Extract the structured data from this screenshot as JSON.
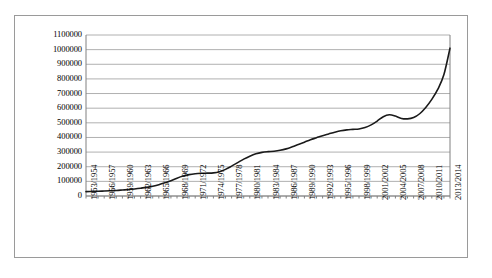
{
  "chart_data": {
    "type": "line",
    "title": "",
    "subtitle": "",
    "xlabel": "",
    "ylabel": "",
    "grid": true,
    "legend": false,
    "legend_position": "none",
    "line_color": "#1a1a1a",
    "gridline_color": "#b0b0b0",
    "axis_color": "#808080",
    "border_color": "#9a9a9a",
    "background_color": "#ffffff",
    "ylim": [
      0,
      1100000
    ],
    "ytick_step": 100000,
    "ytick_labels": [
      "1100000",
      "1000000",
      "900000",
      "800000",
      "700000",
      "600000",
      "500000",
      "400000",
      "300000",
      "200000",
      "100000",
      "0"
    ],
    "ytick_values": [
      1100000,
      1000000,
      900000,
      800000,
      700000,
      600000,
      500000,
      400000,
      300000,
      200000,
      100000,
      0
    ],
    "xtick_labels": [
      "1953/1954",
      "1956/1957",
      "1959/1960",
      "1962/1963",
      "1965/1966",
      "1968/1969",
      "1971/1972",
      "1974/1975",
      "1977/1978",
      "1980/1981",
      "1983/1984",
      "1986/1987",
      "1989/1990",
      "1992/1993",
      "1995/1996",
      "1998/1999",
      "2001/2002",
      "2004/2005",
      "2007/2008",
      "2010/2011",
      "2013/2014"
    ],
    "xtick_label_interval": 3,
    "categories": [
      "1953/1954",
      "1954/1955",
      "1955/1956",
      "1956/1957",
      "1957/1958",
      "1958/1959",
      "1959/1960",
      "1960/1961",
      "1961/1962",
      "1962/1963",
      "1963/1964",
      "1964/1965",
      "1965/1966",
      "1966/1967",
      "1967/1968",
      "1968/1969",
      "1969/1970",
      "1970/1971",
      "1971/1972",
      "1972/1973",
      "1973/1974",
      "1974/1975",
      "1975/1976",
      "1976/1977",
      "1977/1978",
      "1978/1979",
      "1979/1980",
      "1980/1981",
      "1981/1982",
      "1982/1983",
      "1983/1984",
      "1984/1985",
      "1985/1986",
      "1986/1987",
      "1987/1988",
      "1988/1989",
      "1989/1990",
      "1990/1991",
      "1991/1992",
      "1992/1993",
      "1993/1994",
      "1994/1995",
      "1995/1996",
      "1996/1997",
      "1997/1998",
      "1998/1999",
      "1999/2000",
      "2000/2001",
      "2001/2002",
      "2002/2003",
      "2003/2004",
      "2004/2005",
      "2005/2006",
      "2006/2007",
      "2007/2008",
      "2008/2009",
      "2009/2010",
      "2010/2011",
      "2011/2012",
      "2012/2013",
      "2013/2014"
    ],
    "values": [
      30000,
      31000,
      32000,
      34000,
      36000,
      38000,
      41000,
      44000,
      48000,
      53000,
      59000,
      67000,
      77000,
      90000,
      105000,
      122000,
      136000,
      146000,
      152000,
      155000,
      156000,
      158000,
      166000,
      182000,
      204000,
      228000,
      252000,
      272000,
      288000,
      298000,
      303000,
      306000,
      312000,
      322000,
      336000,
      352000,
      368000,
      384000,
      398000,
      412000,
      424000,
      436000,
      446000,
      452000,
      455000,
      458000,
      468000,
      486000,
      512000,
      542000,
      555000,
      546000,
      530000,
      527000,
      536000,
      562000,
      605000,
      660000,
      730000,
      830000,
      1010000
    ]
  }
}
